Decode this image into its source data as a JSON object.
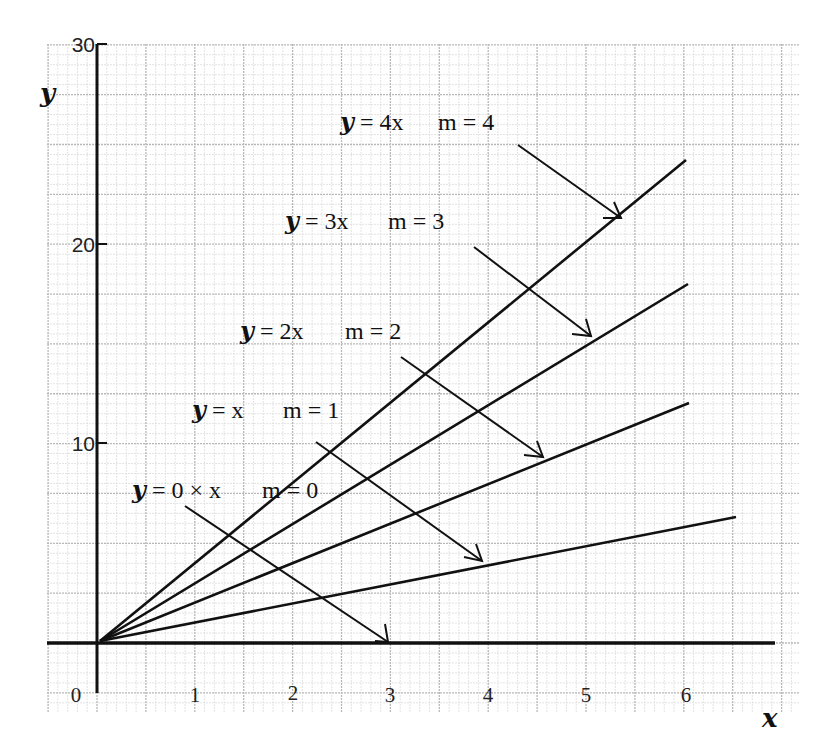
{
  "chart_data": {
    "type": "line",
    "title": "",
    "xlabel": "x",
    "ylabel": "y",
    "xlim": [
      -0.5,
      7
    ],
    "ylim": [
      -2.5,
      30
    ],
    "grid": true,
    "x_ticks": [
      "0",
      "1",
      "2",
      "3",
      "4",
      "5",
      "6"
    ],
    "y_ticks": [
      "10",
      "20",
      "30"
    ],
    "series": [
      {
        "name": "y = 4x",
        "slope_label": "m = 4",
        "slope": 4,
        "x": [
          0,
          6
        ],
        "y": [
          0,
          24
        ]
      },
      {
        "name": "y = 3x",
        "slope_label": "m = 3",
        "slope": 3,
        "x": [
          0,
          6
        ],
        "y": [
          0,
          18
        ]
      },
      {
        "name": "y = 2x",
        "slope_label": "m = 2",
        "slope": 2,
        "x": [
          0,
          6
        ],
        "y": [
          0,
          12
        ]
      },
      {
        "name": "y = x",
        "slope_label": "m = 1",
        "slope": 1,
        "x": [
          0,
          6.5
        ],
        "y": [
          0,
          6.5
        ]
      },
      {
        "name": "y = 0 × x",
        "slope_label": "m = 0",
        "slope": 0,
        "x": [
          0,
          7
        ],
        "y": [
          0,
          0
        ]
      }
    ],
    "annotations": [
      {
        "text": "y = 4x   m = 4",
        "arrow_to": "y = 4x line near x≈5.3"
      },
      {
        "text": "y = 3x   m = 3",
        "arrow_to": "y = 3x line near x≈5.0"
      },
      {
        "text": "y = 2x   m = 2",
        "arrow_to": "y = 2x line near x≈4.6"
      },
      {
        "text": "y = x   m = 1",
        "arrow_to": "y = x line near x≈4.0"
      },
      {
        "text": "y = 0 × x   m = 0",
        "arrow_to": "x-axis at x = 3"
      }
    ]
  },
  "labels": {
    "x_axis": "x",
    "y_axis": "y",
    "origin": "0",
    "line4": {
      "eq_y": "y",
      "eq_rest": " = 4x",
      "m": "m = 4"
    },
    "line3": {
      "eq_y": "y",
      "eq_rest": " = 3x",
      "m": "m = 3"
    },
    "line2": {
      "eq_y": "y",
      "eq_rest": " = 2x",
      "m": "m = 2"
    },
    "line1": {
      "eq_y": "y",
      "eq_rest": " = x",
      "m": "m = 1"
    },
    "line0": {
      "eq_y": "y",
      "eq_rest": " = 0 × x",
      "m": "m = 0"
    }
  },
  "colors": {
    "ink": "#111111",
    "grid_major": "#b8b8b8",
    "grid_minor": "#dcdcdc"
  }
}
